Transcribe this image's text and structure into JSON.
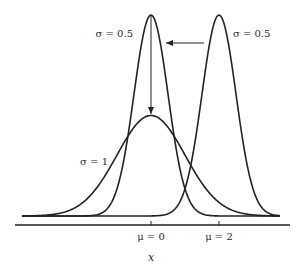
{
  "diagram": {
    "title": "",
    "axis": {
      "label": "x",
      "ticks": [
        "μ = 0",
        "μ = 2"
      ]
    },
    "curves": [
      {
        "name": "narrow-centered",
        "mu": 0,
        "sigma": 0.5,
        "label": "σ = 0.5",
        "label_side": "left"
      },
      {
        "name": "narrow-shifted",
        "mu": 2,
        "sigma": 0.5,
        "label": "σ = 0.5",
        "label_side": "right"
      },
      {
        "name": "wide-centered",
        "mu": 0,
        "sigma": 1,
        "label": "σ = 1",
        "label_side": "left"
      }
    ],
    "arrows": [
      {
        "from": "narrow-shifted",
        "to": "narrow-centered",
        "direction": "left"
      },
      {
        "from": "narrow-centered",
        "to": "wide-centered",
        "direction": "down"
      }
    ],
    "colors": {
      "stroke": "#222222",
      "background": "#ffffff"
    }
  }
}
